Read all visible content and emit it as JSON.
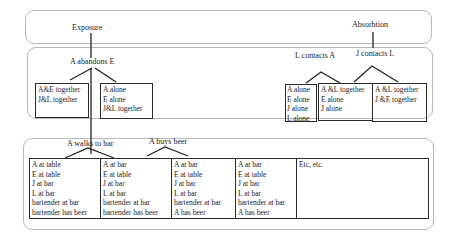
{
  "sections": {
    "top_labels": {
      "exposure": "Exposure",
      "absorption": "Absorbtion"
    },
    "middle": {
      "exposure_event": "A abandons E",
      "exposure_outcomes": [
        {
          "lines": [
            "A&E together",
            "J&L together"
          ]
        },
        {
          "lines": [
            "A alone",
            "E alone",
            "J&L together"
          ]
        }
      ],
      "absorption_events": [
        "L contacts A",
        "J contacts L"
      ],
      "absorption_outcomes": [
        {
          "lines": [
            "A alone",
            "E alone",
            "J alone",
            "L alone"
          ]
        },
        {
          "lines": [
            "A &L together",
            "E alone",
            "J alone"
          ]
        },
        {
          "lines": [
            "A &L together",
            "J &E together"
          ]
        }
      ]
    },
    "bottom": {
      "events": [
        "A walks to bar",
        "A buys beer"
      ],
      "states": [
        {
          "lines": [
            "A at table",
            "E at table",
            "J at bar",
            "L at bar",
            "bartender at bar",
            "bartender has beer"
          ]
        },
        {
          "lines": [
            "A at bar",
            "E at table",
            "J at bar",
            "L at bar",
            "bartender at bar",
            "bartender has beer"
          ]
        },
        {
          "lines": [
            "A at bar",
            "E at table",
            "J at bar",
            "L at bar",
            "bartender at bar",
            "A has beer"
          ]
        },
        {
          "lines": [
            "A at bar",
            "E at table",
            "J at bar",
            "L at bar",
            "bartender at bar",
            "A has beer"
          ]
        },
        {
          "lines": [
            "Etc, etc."
          ]
        }
      ]
    }
  }
}
